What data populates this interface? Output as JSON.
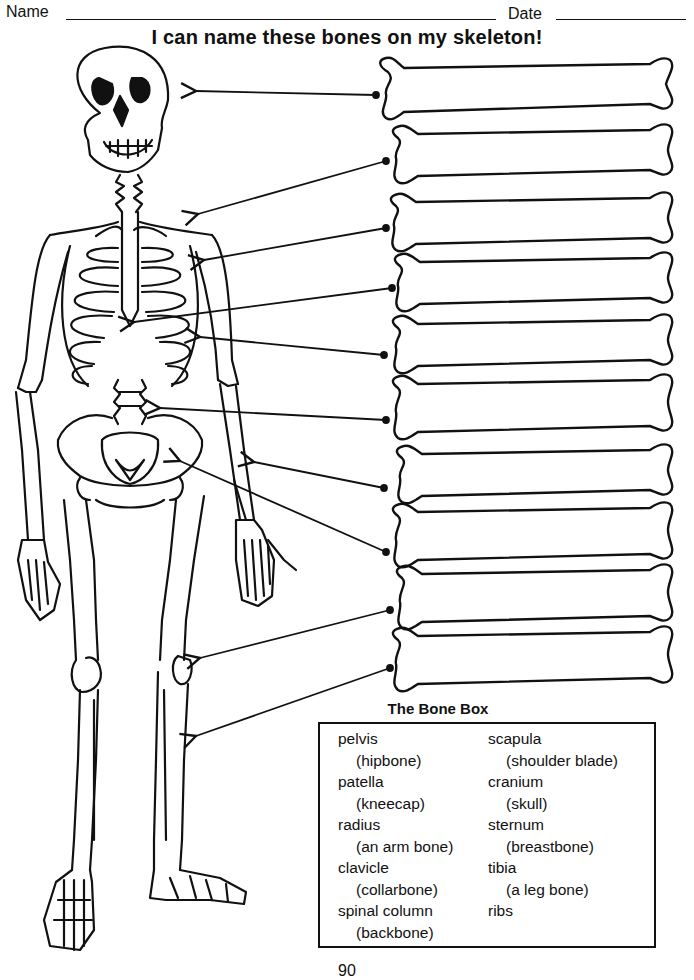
{
  "header": {
    "name_label": "Name",
    "date_label": "Date"
  },
  "title": "I can name these bones on my skeleton!",
  "label_bones": [
    {
      "id": 1,
      "answer": "",
      "points_to": "cranium"
    },
    {
      "id": 2,
      "answer": "",
      "points_to": "clavicle"
    },
    {
      "id": 3,
      "answer": "",
      "points_to": "scapula"
    },
    {
      "id": 4,
      "answer": "",
      "points_to": "sternum"
    },
    {
      "id": 5,
      "answer": "",
      "points_to": "ribs"
    },
    {
      "id": 6,
      "answer": "",
      "points_to": "spinal column"
    },
    {
      "id": 7,
      "answer": "",
      "points_to": "radius"
    },
    {
      "id": 8,
      "answer": "",
      "points_to": "pelvis"
    },
    {
      "id": 9,
      "answer": "",
      "points_to": "patella"
    },
    {
      "id": 10,
      "answer": "",
      "points_to": "tibia"
    }
  ],
  "bone_box": {
    "title": "The Bone Box",
    "left_column": [
      {
        "term": "pelvis",
        "desc": "(hipbone)"
      },
      {
        "term": "patella",
        "desc": "(kneecap)"
      },
      {
        "term": "radius",
        "desc": "(an arm bone)"
      },
      {
        "term": "clavicle",
        "desc": "(collarbone)"
      },
      {
        "term": "spinal column",
        "desc": "(backbone)"
      }
    ],
    "right_column": [
      {
        "term": "scapula",
        "desc": "(shoulder blade)"
      },
      {
        "term": "cranium",
        "desc": "(skull)"
      },
      {
        "term": "sternum",
        "desc": "(breastbone)"
      },
      {
        "term": "tibia",
        "desc": "(a leg bone)"
      },
      {
        "term": "ribs",
        "desc": ""
      }
    ]
  },
  "page_number": "90"
}
